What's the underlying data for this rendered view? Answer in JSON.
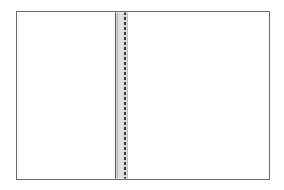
{
  "figure": {
    "description": "Line drawing of an open blank book showing two facing blank pages joined at a gray spine with a dashed stitching line.",
    "width_px": 284,
    "height_px": 190,
    "background_color": "#ffffff"
  },
  "book": {
    "outline_label": "book-outline",
    "border_color": "#6b6b6b",
    "fill_color": "#ffffff",
    "left_px": 16,
    "top_px": 11,
    "width_px": 254,
    "height_px": 169
  },
  "pages": [
    {
      "name": "left-page",
      "label": "Left page",
      "content": "",
      "fill_color": "#fefefe"
    },
    {
      "name": "right-page",
      "label": "Right page",
      "content": "",
      "fill_color": "#fefefe"
    }
  ],
  "spine": {
    "label": "Spine",
    "band_color": "#d8d8d8",
    "rule_color": "#5a5a5a",
    "inner_rule_color": "#b4b4b4",
    "edge_color": "#c6c6c6",
    "stitch_color": "#3a3a3a",
    "stitch_style": "dashed",
    "stitch_dash_px": 3,
    "stitch_gap_px": 2,
    "left_px": 113,
    "width_px": 15
  }
}
